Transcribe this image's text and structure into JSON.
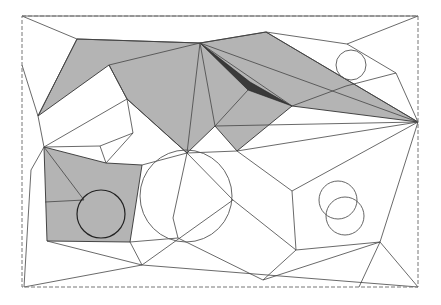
{
  "diagram": {
    "type": "polygonal-map-with-circular-obstacles",
    "border": {
      "x1": 22,
      "y1": 16,
      "x2": 418,
      "y2": 287,
      "style": "dashed"
    },
    "colors": {
      "shade": "#b4b4b4",
      "edge": "#444444",
      "dark_sliver": "#3a3a3a",
      "background": "#ffffff"
    },
    "shaded_regions": [
      {
        "name": "upper-shaded-region",
        "points": "77,39 200,43 266,32 418,122 292,106 237,151 215,126 187,153 127,99 109,65 38,116"
      },
      {
        "name": "lower-left-shaded-region",
        "points": "44,147 106,163 142,165 130,242 47,241"
      }
    ],
    "dark_regions": [
      {
        "name": "dark-sliver",
        "points": "200,43 248,90 292,106 250,82"
      }
    ],
    "edges": [
      "22,16 77,39",
      "22,16 418,16",
      "77,39 200,43",
      "200,43 266,32",
      "266,32 347,44",
      "347,44 418,16",
      "347,44 396,73",
      "396,73 418,122",
      "266,32 418,122",
      "200,43 418,122",
      "200,43 187,153",
      "200,43 215,126",
      "200,43 292,106",
      "248,90 215,126",
      "292,106 346,86",
      "346,86 396,73",
      "215,126 418,122",
      "109,65 200,43",
      "109,65 127,99",
      "127,99 187,153",
      "77,39 38,116",
      "22,65 38,116",
      "38,116 44,147",
      "44,147 127,99",
      "127,99 133,133",
      "133,133 106,163",
      "100,146 133,133",
      "44,147 100,146",
      "100,146 106,163",
      "44,147 84,200",
      "45,202 84,200",
      "142,165 187,153",
      "187,153 237,151",
      "187,153 233,200",
      "187,153 173,218",
      "237,151 418,122",
      "237,151 292,191",
      "292,191 418,122",
      "292,191 296,250",
      "233,200 296,250",
      "233,200 142,265",
      "173,218 178,238",
      "178,238 263,280",
      "142,265 130,242",
      "142,265 418,287",
      "44,147 31,170",
      "31,170 24,287",
      "24,287 142,265",
      "47,241 142,265",
      "296,250 380,242",
      "263,280 296,250",
      "263,280 380,242",
      "380,242 418,122",
      "380,242 359,287",
      "380,242 418,287",
      "130,242 178,238"
    ],
    "circles": [
      {
        "name": "top-right-circle",
        "cx": 351,
        "cy": 65,
        "r": 15,
        "style": "light"
      },
      {
        "name": "lower-left-circle",
        "cx": 101,
        "cy": 214,
        "r": 24,
        "style": "dark"
      },
      {
        "name": "center-large-circle",
        "cx": 186,
        "cy": 196,
        "r": 46,
        "style": "light"
      },
      {
        "name": "right-circle-upper",
        "cx": 338,
        "cy": 200,
        "r": 19,
        "style": "light"
      },
      {
        "name": "right-circle-lower",
        "cx": 345,
        "cy": 216,
        "r": 19,
        "style": "light"
      }
    ]
  }
}
